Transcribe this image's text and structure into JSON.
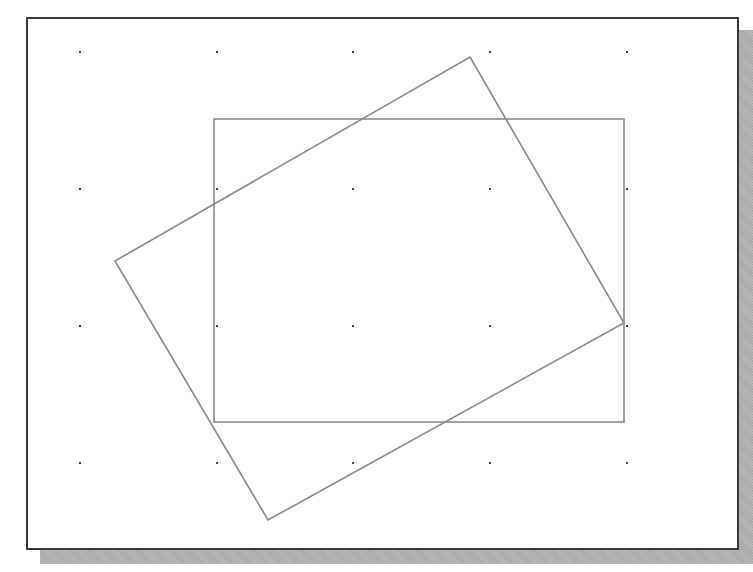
{
  "figure": {
    "colors": {
      "frame_border": "#3a3a3a",
      "shadow": "#b0b0b0",
      "line": "#8a8a8a",
      "grid_dot": "#444444",
      "background": "#ffffff"
    },
    "grid": {
      "x": [
        80,
        217,
        353,
        490,
        627
      ],
      "y": [
        52,
        189,
        326,
        463
      ]
    },
    "shapes": [
      {
        "name": "axis-aligned-rectangle",
        "x": 214,
        "y": 119,
        "width": 410,
        "height": 303
      },
      {
        "name": "rotated-rectangle",
        "points": [
          [
            470,
            57
          ],
          [
            624,
            323
          ],
          [
            268,
            520
          ],
          [
            115,
            261
          ]
        ]
      }
    ]
  }
}
